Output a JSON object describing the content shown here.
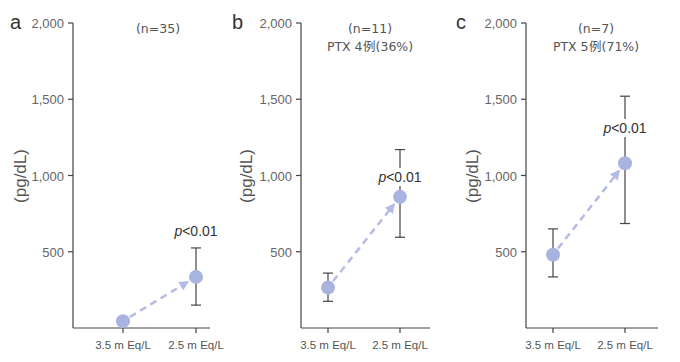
{
  "chart_data": [
    {
      "type": "scatter",
      "panel": "a",
      "title": "(n=35)",
      "subtitle": "",
      "ylabel": "(pg/dL)",
      "xlabel": "",
      "categories": [
        "3.5 m Eq/L",
        "2.5 m Eq/L"
      ],
      "yticks": [
        "2,000",
        "1,500",
        "1,000",
        "500"
      ],
      "ylim": [
        0,
        2000
      ],
      "series": [
        {
          "name": "mean",
          "values": [
            45,
            335
          ],
          "err_low": [
            null,
            150
          ],
          "err_high": [
            null,
            525
          ]
        }
      ],
      "annotation": "p<0.01",
      "arrow": "dashed from first to second point"
    },
    {
      "type": "scatter",
      "panel": "b",
      "title": "(n=11)",
      "subtitle": "PTX 4例(36%)",
      "ylabel": "(pg/dL)",
      "xlabel": "",
      "categories": [
        "3.5 m Eq/L",
        "2.5 m Eq/L"
      ],
      "yticks": [
        "2,000",
        "1,500",
        "1,000",
        "500"
      ],
      "ylim": [
        0,
        2000
      ],
      "series": [
        {
          "name": "mean",
          "values": [
            265,
            860
          ],
          "err_low": [
            175,
            595
          ],
          "err_high": [
            360,
            1170
          ]
        }
      ],
      "annotation": "p<0.01",
      "arrow": "dashed from first to second point"
    },
    {
      "type": "scatter",
      "panel": "c",
      "title": "(n=7)",
      "subtitle": "PTX 5例(71%)",
      "ylabel": "(pg/dL)",
      "xlabel": "",
      "categories": [
        "3.5 m Eq/L",
        "2.5 m Eq/L"
      ],
      "yticks": [
        "2,000",
        "1,500",
        "1,000",
        "500"
      ],
      "ylim": [
        0,
        2000
      ],
      "series": [
        {
          "name": "mean",
          "values": [
            480,
            1080
          ],
          "err_low": [
            335,
            685
          ],
          "err_high": [
            650,
            1520
          ]
        }
      ],
      "annotation": "p<0.01",
      "arrow": "dashed from first to second point"
    }
  ],
  "style": {
    "point_color": "#a9b3e0",
    "arrow_color": "#b4bce6",
    "axis_color": "#444444"
  }
}
